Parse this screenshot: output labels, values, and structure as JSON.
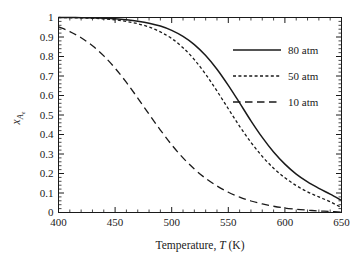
{
  "chart_data": {
    "type": "line",
    "title": "",
    "xlabel": "Temperature, T (K)",
    "xlabel_parts": {
      "pre": "Temperature, ",
      "symbol": "T",
      "post": " (K)"
    },
    "ylabel": "xAe",
    "ylabel_parts": {
      "symbol": "x",
      "subscript": "A",
      "subsubscript": "e"
    },
    "xlim": [
      400,
      650
    ],
    "ylim": [
      0,
      1
    ],
    "xticks": [
      400,
      450,
      500,
      550,
      600,
      650
    ],
    "xtick_labels": [
      "400",
      "450",
      "500",
      "550",
      "600",
      "650"
    ],
    "x_minor_step": 10,
    "yticks": [
      0,
      0.1,
      0.2,
      0.3,
      0.4,
      0.5,
      0.6,
      0.7,
      0.8,
      0.9,
      1
    ],
    "ytick_labels": [
      "0",
      "0.1",
      "0.2",
      "0.3",
      "0.4",
      "0.5",
      "0.6",
      "0.7",
      "0.8",
      "0.9",
      "1"
    ],
    "y_minor_step": 0.02,
    "grid": false,
    "legend_position": "top-right-inside",
    "series": [
      {
        "name": "80 atm",
        "style": "solid",
        "color": "#1a1a1a",
        "x": [
          400,
          410,
          420,
          430,
          440,
          450,
          460,
          470,
          480,
          490,
          500,
          510,
          520,
          530,
          540,
          550,
          560,
          570,
          580,
          590,
          600,
          610,
          620,
          630,
          640,
          650
        ],
        "y": [
          1.0,
          1.0,
          0.999,
          0.998,
          0.996,
          0.993,
          0.988,
          0.981,
          0.971,
          0.956,
          0.934,
          0.903,
          0.861,
          0.805,
          0.735,
          0.652,
          0.562,
          0.47,
          0.385,
          0.31,
          0.248,
          0.197,
          0.157,
          0.124,
          0.094,
          0.062
        ]
      },
      {
        "name": "50 atm",
        "style": "dotted",
        "color": "#1a1a1a",
        "x": [
          400,
          410,
          420,
          430,
          440,
          450,
          460,
          470,
          480,
          490,
          500,
          510,
          520,
          530,
          540,
          550,
          560,
          570,
          580,
          590,
          600,
          610,
          620,
          630,
          640,
          650
        ],
        "y": [
          1.0,
          0.999,
          0.998,
          0.996,
          0.993,
          0.988,
          0.98,
          0.968,
          0.951,
          0.926,
          0.892,
          0.845,
          0.784,
          0.709,
          0.623,
          0.532,
          0.442,
          0.36,
          0.288,
          0.227,
          0.178,
          0.138,
          0.106,
          0.08,
          0.055,
          0.025
        ]
      },
      {
        "name": "10 atm",
        "style": "dashed",
        "color": "#1a1a1a",
        "x": [
          400,
          410,
          420,
          430,
          440,
          450,
          460,
          470,
          480,
          490,
          500,
          510,
          520,
          530,
          540,
          550,
          560,
          570,
          580,
          590,
          600,
          610,
          620,
          630,
          640,
          650
        ],
        "y": [
          0.952,
          0.928,
          0.896,
          0.855,
          0.803,
          0.74,
          0.667,
          0.587,
          0.504,
          0.423,
          0.347,
          0.28,
          0.223,
          0.175,
          0.136,
          0.104,
          0.079,
          0.059,
          0.044,
          0.032,
          0.023,
          0.017,
          0.012,
          0.008,
          0.005,
          0.002
        ]
      }
    ]
  },
  "legend": {
    "entries": [
      {
        "label": "80 atm"
      },
      {
        "label": "50 atm"
      },
      {
        "label": "10 atm"
      }
    ]
  }
}
